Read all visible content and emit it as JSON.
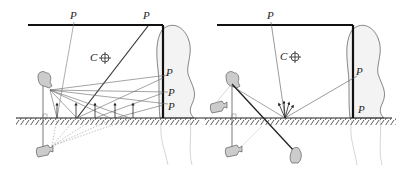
{
  "diagram": {
    "panels": [
      {
        "id": "left",
        "labels": {
          "p_top_1": "P",
          "p_top_2": "P",
          "p_wall_1": "P",
          "p_wall_2": "P",
          "p_wall_3": "P",
          "center": "C"
        }
      },
      {
        "id": "right",
        "labels": {
          "p_top": "P",
          "p_wall": "P",
          "p_corner": "P",
          "center": "C"
        }
      }
    ],
    "colors": {
      "stroke": "#222222",
      "wall": "#111111",
      "ray": "#666666",
      "faint": "#bbbbbb",
      "camera_fill": "#cccccc",
      "figure_fill": "#f3f3f3"
    }
  }
}
